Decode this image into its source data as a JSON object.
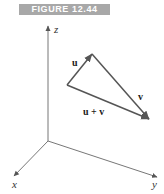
{
  "figure": {
    "banner_label": "FIGURE 12.44",
    "banner_color": "#a8a8a8"
  },
  "axes": {
    "x_label": "x",
    "y_label": "y",
    "z_label": "z",
    "color": "#666666"
  },
  "vectors": {
    "u_label": "u",
    "v_label": "v",
    "sum_label": "u + v",
    "color": "#555555"
  }
}
